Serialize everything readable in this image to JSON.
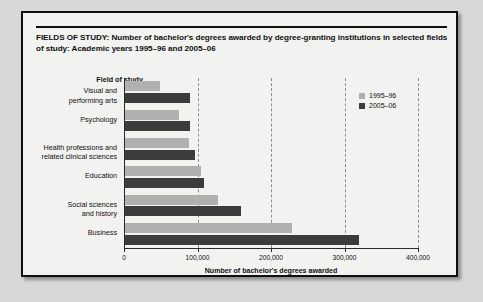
{
  "figure": {
    "title": "FIELDS OF STUDY: Number of bachelor's degrees awarded by degree-granting institutions in selected fields of study: Academic years 1995–96 and 2005–06",
    "category_axis_header": "Field of study"
  },
  "colors": {
    "series_1995": "#b0b0b0",
    "series_2005": "#3c3c3c",
    "card_background": "#f2f2f0",
    "page_background": "#d8d8d6",
    "border": "#0e0e0e",
    "gridline": "#8d8d8d"
  },
  "legend": {
    "position": "top-right",
    "items": [
      {
        "label": "1995–96",
        "color": "#b0b0b0"
      },
      {
        "label": "2005–06",
        "color": "#3c3c3c"
      }
    ]
  },
  "chart_data": {
    "type": "bar",
    "orientation": "horizontal",
    "title": "FIELDS OF STUDY: Number of bachelor's degrees awarded by degree-granting institutions in selected fields of study: Academic years 1995–96 and 2005–06",
    "xlabel": "Number of bachelor's degrees awarded",
    "ylabel": "Field of study",
    "xlim": [
      0,
      400000
    ],
    "xticks": [
      0,
      100000,
      200000,
      300000,
      400000
    ],
    "xtick_labels": [
      "0",
      "100,000",
      "200,000",
      "300,000",
      "400,000"
    ],
    "grid": true,
    "grid_axis": "x",
    "categories": [
      "Visual and\nperforming arts",
      "Psychology",
      "Health professions and\nrelated clinical sciences",
      "Education",
      "Social sciences\nand history",
      "Business"
    ],
    "series": [
      {
        "name": "1995–96",
        "color": "#b0b0b0",
        "values": [
          48000,
          73000,
          87000,
          103000,
          126000,
          227000
        ]
      },
      {
        "name": "2005–06",
        "color": "#3c3c3c",
        "values": [
          89000,
          88000,
          95000,
          107000,
          158000,
          318000
        ]
      }
    ]
  }
}
